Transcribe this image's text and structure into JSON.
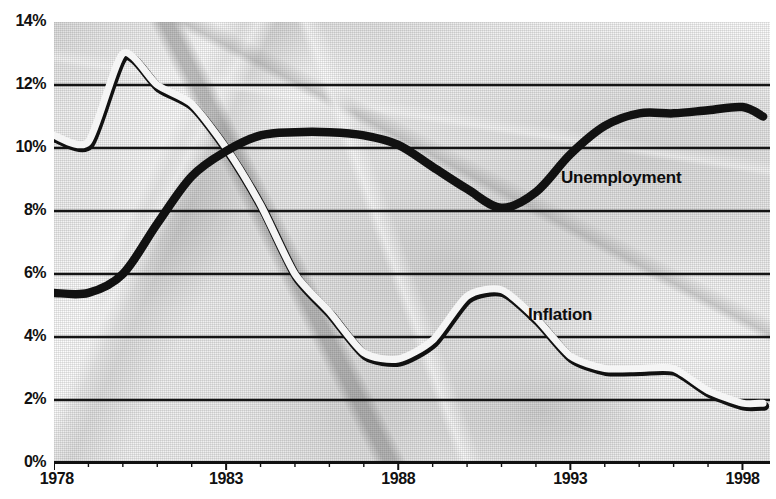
{
  "chart_data": {
    "type": "line",
    "title": "",
    "xlabel": "",
    "ylabel": "",
    "xlim": [
      1978,
      1998.8
    ],
    "ylim": [
      0,
      14
    ],
    "grid": true,
    "grid_axis": "y",
    "legend": "inline-annotation",
    "y_tick_labels": [
      "0%",
      "2%",
      "4%",
      "6%",
      "8%",
      "10%",
      "12%",
      "14%"
    ],
    "y_ticks": [
      0,
      2,
      4,
      6,
      8,
      10,
      12,
      14
    ],
    "x_tick_labels": [
      "1978",
      "1983",
      "1988",
      "1993",
      "1998"
    ],
    "x_ticks": [
      1978,
      1983,
      1988,
      1993,
      1998
    ],
    "x_minor_tick_interval": 1,
    "units": "percent",
    "series": [
      {
        "name": "Unemployment",
        "color": "#111111",
        "style": "thick-solid",
        "x": [
          1978,
          1979,
          1980,
          1981,
          1982,
          1983,
          1984,
          1985,
          1986,
          1987,
          1988,
          1989,
          1990,
          1991,
          1992,
          1993,
          1994,
          1995,
          1996,
          1997,
          1998,
          1998.6
        ],
        "values": [
          5.4,
          5.4,
          6.0,
          7.6,
          9.1,
          9.9,
          10.4,
          10.5,
          10.5,
          10.4,
          10.1,
          9.4,
          8.7,
          8.1,
          8.6,
          9.8,
          10.7,
          11.1,
          11.1,
          11.2,
          11.3,
          11.0
        ]
      },
      {
        "name": "Inflation",
        "color": "#f5f5f5",
        "outline": "#111111",
        "style": "thin-outlined",
        "x": [
          1978,
          1979,
          1980,
          1981,
          1982,
          1983,
          1984,
          1985,
          1986,
          1987,
          1988,
          1989,
          1990,
          1991,
          1992,
          1993,
          1994,
          1995,
          1996,
          1997,
          1998,
          1998.6
        ],
        "values": [
          10.4,
          10.2,
          13.0,
          12.0,
          11.4,
          10.0,
          8.2,
          6.0,
          4.8,
          3.5,
          3.3,
          3.9,
          5.3,
          5.5,
          4.6,
          3.4,
          3.0,
          3.0,
          3.0,
          2.3,
          1.9,
          1.9
        ]
      }
    ],
    "annotations": [
      {
        "text": "Unemployment",
        "x_px": 561,
        "y_px": 168
      },
      {
        "text": "Inflation",
        "x_px": 528,
        "y_px": 305
      }
    ]
  }
}
